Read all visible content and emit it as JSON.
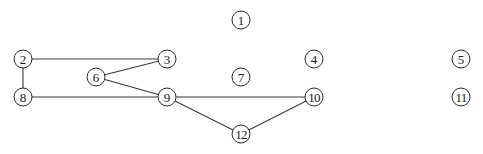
{
  "graph": {
    "node_radius": 9,
    "colors": {
      "edge": "#3a3a3a",
      "node_stroke": "#2a2a2a",
      "node_fill": "#ffffff",
      "label": "#1a1a1a"
    },
    "nodes": [
      {
        "id": "1",
        "label": "1",
        "x": 241,
        "y": 20
      },
      {
        "id": "2",
        "label": "2",
        "x": 23,
        "y": 59
      },
      {
        "id": "3",
        "label": "3",
        "x": 167,
        "y": 59
      },
      {
        "id": "4",
        "label": "4",
        "x": 314,
        "y": 59
      },
      {
        "id": "5",
        "label": "5",
        "x": 461,
        "y": 59
      },
      {
        "id": "6",
        "label": "6",
        "x": 96,
        "y": 77
      },
      {
        "id": "7",
        "label": "7",
        "x": 241,
        "y": 77
      },
      {
        "id": "8",
        "label": "8",
        "x": 23,
        "y": 97
      },
      {
        "id": "9",
        "label": "9",
        "x": 167,
        "y": 97
      },
      {
        "id": "10",
        "label": "10",
        "x": 314,
        "y": 97
      },
      {
        "id": "11",
        "label": "11",
        "x": 461,
        "y": 97
      },
      {
        "id": "12",
        "label": "12",
        "x": 241,
        "y": 134
      }
    ],
    "edges": [
      {
        "from": "2",
        "to": "3"
      },
      {
        "from": "2",
        "to": "8"
      },
      {
        "from": "3",
        "to": "6"
      },
      {
        "from": "6",
        "to": "9"
      },
      {
        "from": "8",
        "to": "9"
      },
      {
        "from": "9",
        "to": "10"
      },
      {
        "from": "9",
        "to": "12"
      },
      {
        "from": "12",
        "to": "10"
      }
    ]
  }
}
